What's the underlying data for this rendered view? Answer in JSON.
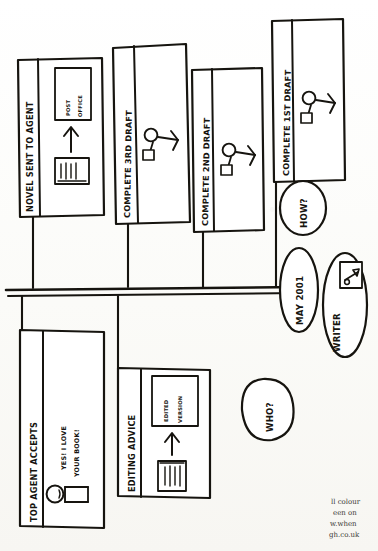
{
  "page": {
    "orientation": "rotated-90-clockwise",
    "background_color": "#fdfdfb",
    "ink_color": "#16140f"
  },
  "timeline": {
    "axis_name": "main-timeline-axis",
    "start_label": "MAY 2001",
    "actor_label": "WRITER",
    "actor_icon": "pen-in-box-icon"
  },
  "questions": [
    {
      "id": "how",
      "label": "HOW?"
    },
    {
      "id": "who",
      "label": "WHO?"
    }
  ],
  "milestones_above": [
    {
      "id": "complete-1st-draft",
      "label": "COMPLETE 1ST DRAFT",
      "icon": "stick-figure-with-bag-icon",
      "inner_texts": []
    },
    {
      "id": "complete-2nd-draft",
      "label": "COMPLETE 2ND DRAFT",
      "icon": "stick-figure-with-bag-icon",
      "inner_texts": []
    },
    {
      "id": "complete-3rd-draft",
      "label": "COMPLETE 3RD DRAFT",
      "icon": "stick-figure-with-bag-icon",
      "inner_texts": []
    },
    {
      "id": "novel-sent-to-agent",
      "label": "NOVEL SENT TO AGENT",
      "icon": "manuscript-arrow-postoffice-icon",
      "inner_texts": [
        "POST",
        "OFFICE"
      ]
    }
  ],
  "milestones_below": [
    {
      "id": "top-agent-accepts",
      "label": "TOP AGENT ACCEPTS",
      "icon": "smiling-agent-icon",
      "inner_texts": [
        "YES! I LOVE",
        "YOUR BOOK!"
      ]
    },
    {
      "id": "editing-advice",
      "label": "EDITING ADVICE",
      "icon": "manuscript-arrow-edited-icon",
      "inner_texts": [
        "EDITED",
        "VERSION"
      ]
    }
  ],
  "credit_lines": [
    "ll colour",
    "een on",
    "w.when",
    "gh.co.uk"
  ]
}
